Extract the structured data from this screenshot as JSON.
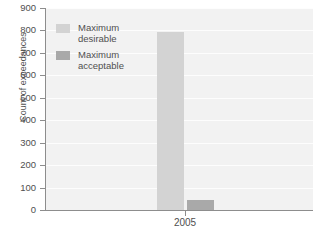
{
  "chart_data": {
    "type": "bar",
    "title": "",
    "xlabel": "",
    "ylabel": "Count of exceedances",
    "categories": [
      "2005"
    ],
    "ylim": [
      0,
      900
    ],
    "ytick_labels": [
      "900",
      "800",
      "700",
      "600",
      "500",
      "400",
      "300",
      "200",
      "100",
      "0"
    ],
    "ytick_values": [
      900,
      800,
      700,
      600,
      500,
      400,
      300,
      200,
      100,
      0
    ],
    "grid": true,
    "legend_position": "top-left-inside",
    "series": [
      {
        "name": "Maximum desirable",
        "color": "#d3d3d3",
        "values": [
          795
        ]
      },
      {
        "name": "Maximum acceptable",
        "color": "#a9a9a9",
        "values": [
          45
        ]
      }
    ]
  },
  "legend": {
    "items": [
      {
        "label_line1": "Maximum",
        "label_line2": "desirable",
        "color": "#d3d3d3"
      },
      {
        "label_line1": "Maximum",
        "label_line2": "acceptable",
        "color": "#a9a9a9"
      }
    ]
  },
  "axes": {
    "y_title": "Count of exceedances",
    "x_tick_2005": "2005"
  },
  "colors": {
    "plot_background": "#f2f2f2",
    "gridline": "#fdfdfd",
    "axis": "#8d8d8d",
    "text": "#4f4f4f",
    "series_desirable": "#d3d3d3",
    "series_acceptable": "#a9a9a9"
  }
}
